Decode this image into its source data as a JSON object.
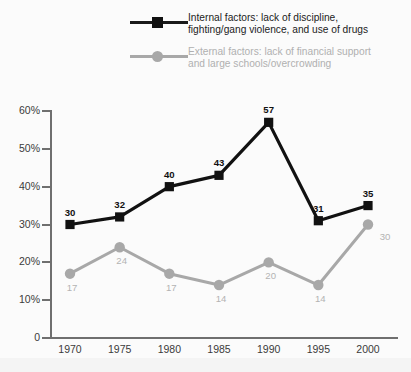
{
  "chart_data": {
    "type": "line",
    "title": "",
    "xlabel": "",
    "ylabel": "",
    "x": [
      "1970",
      "1975",
      "1980",
      "1985",
      "1990",
      "1995",
      "2000"
    ],
    "categories": [
      "1970",
      "1975",
      "1980",
      "1985",
      "1990",
      "1995",
      "2000"
    ],
    "series": [
      {
        "name": "Internal factors: lack of discipline,\nfighting/gang violence, and use of drugs",
        "short_name": "Internal factors",
        "color": "#111111",
        "marker": "square",
        "values": [
          30,
          32,
          40,
          43,
          57,
          31,
          35
        ]
      },
      {
        "name": "External factors: lack of financial support\nand large schools/overcrowding",
        "short_name": "External factors",
        "color": "#a8a8a8",
        "marker": "circle",
        "values": [
          17,
          24,
          17,
          14,
          20,
          14,
          30
        ]
      }
    ],
    "ylim": [
      0,
      60
    ],
    "yticks": [
      0,
      10,
      20,
      30,
      40,
      50,
      60
    ],
    "ytick_labels": [
      "0",
      "10%",
      "20%",
      "30%",
      "40%",
      "50%",
      "60%"
    ],
    "grid": false,
    "legend_position": "top-center"
  },
  "legend": {
    "entries": [
      {
        "label": "Internal factors: lack of discipline,\nfighting/gang violence, and use of drugs",
        "color": "#111111"
      },
      {
        "label": "External factors: lack of financial support\nand large schools/overcrowding",
        "color": "#a8a8a8"
      }
    ]
  },
  "colors": {
    "internal": "#111111",
    "external": "#a8a8a8",
    "axis": "#6f6f6f",
    "background": "#f4f4f4",
    "plot_background": "#fbfbfb"
  }
}
